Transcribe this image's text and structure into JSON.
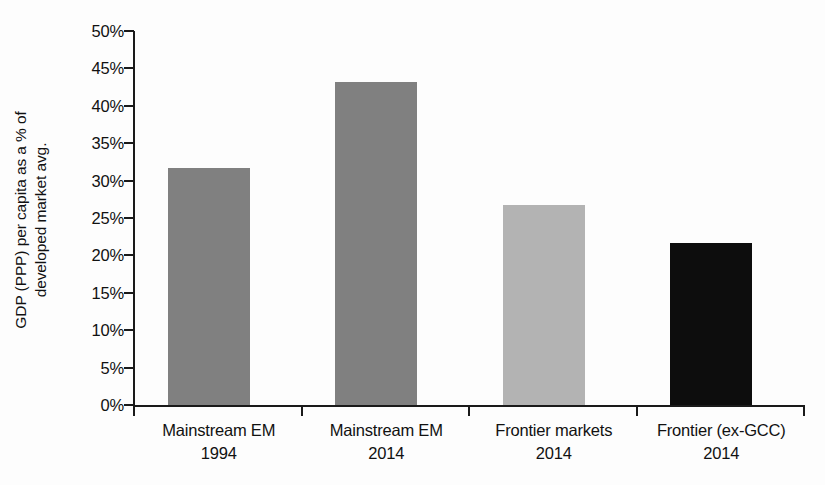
{
  "chart_data": {
    "type": "bar",
    "title": "",
    "subtitle": "",
    "xlabel": "",
    "ylabel": "GDP (PPP) per capita as a % of developed market avg.",
    "ylabel_lines": [
      "GDP (PPP) per capita as a % of",
      "developed market avg."
    ],
    "categories": [
      "Mainstream EM 1994",
      "Mainstream EM 2014",
      "Frontier markets 2014",
      "Frontier (ex-GCC) 2014"
    ],
    "category_lines": [
      {
        "line1": "Mainstream EM",
        "line2": "1994"
      },
      {
        "line1": "Mainstream EM",
        "line2": "2014"
      },
      {
        "line1": "Frontier markets",
        "line2": "2014"
      },
      {
        "line1": "Frontier (ex-GCC)",
        "line2": "2014"
      }
    ],
    "values": [
      31.7,
      43.2,
      26.8,
      21.6
    ],
    "bar_colors": [
      "#808080",
      "#808080",
      "#b3b3b3",
      "#0d0d0d"
    ],
    "ylim": [
      0,
      50
    ],
    "ytick_values": [
      0,
      5,
      10,
      15,
      20,
      25,
      30,
      35,
      40,
      45,
      50
    ],
    "ytick_labels": [
      "0%",
      "5%",
      "10%",
      "15%",
      "20%",
      "25%",
      "30%",
      "35%",
      "40%",
      "45%",
      "50%"
    ],
    "grid": false,
    "legend": false,
    "units": "percent"
  },
  "style": {
    "axis_color": "#1a1a1a",
    "background": "#fdfdfd",
    "text_color": "#111111"
  }
}
